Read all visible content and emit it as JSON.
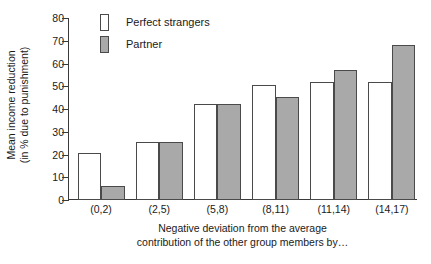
{
  "chart_data": {
    "type": "bar",
    "title": "",
    "categories": [
      "(0,2)",
      "(2,5)",
      "(5,8)",
      "(8,11)",
      "(11,14)",
      "(14,17)"
    ],
    "series": [
      {
        "name": "Perfect strangers",
        "color": "#ffffff",
        "values": [
          20.5,
          25.5,
          42.0,
          50.5,
          51.5,
          51.5
        ]
      },
      {
        "name": "Partner",
        "color": "#a9a9a9",
        "values": [
          6.0,
          25.5,
          42.0,
          45.0,
          57.0,
          68.0
        ]
      }
    ],
    "ylabel_line1": "Mean income reduction",
    "ylabel_line2": "(in % due to punishment)",
    "xlabel_line1": "Negative deviation from the average",
    "xlabel_line2": "contribution of the other group members by…",
    "yticks": [
      0,
      10,
      20,
      30,
      40,
      50,
      60,
      70,
      80
    ],
    "ylim": [
      0,
      80
    ],
    "grid": false,
    "legend_position": "top-left-inside",
    "axis_color": "#3a3a3a",
    "bar_border_color": "#4a4a4a"
  },
  "legend": {
    "items": [
      {
        "label": "Perfect strangers",
        "swatch": "strangers"
      },
      {
        "label": "Partner",
        "swatch": "partner"
      }
    ]
  }
}
